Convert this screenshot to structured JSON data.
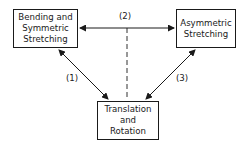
{
  "nodes": {
    "bending": {
      "lines": [
        "Bending and",
        "Symmetric",
        "Stretching"
      ]
    },
    "asymmetric": {
      "lines": [
        "Asymmetric",
        "Stretching"
      ]
    },
    "translation": {
      "lines": [
        "Translation",
        "and",
        "Rotation"
      ]
    }
  },
  "edges": [
    {
      "label": "(1)",
      "from": "bending",
      "to": "translation",
      "style": "solid",
      "arrows": "both"
    },
    {
      "label": "(2)",
      "from": "bending",
      "to": "asymmetric",
      "style": "solid",
      "arrows": "both"
    },
    {
      "label": "(3)",
      "from": "asymmetric",
      "to": "translation",
      "style": "solid",
      "arrows": "both"
    }
  ],
  "divider": {
    "style": "dashed"
  },
  "colors": {
    "stroke": "#1a1a1a",
    "background": "#ffffff"
  }
}
